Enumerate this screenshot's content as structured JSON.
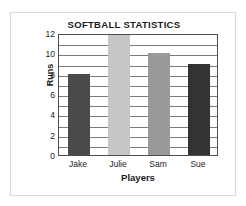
{
  "chart_data": {
    "type": "bar",
    "title": "SOFTBALL STATISTICS",
    "xlabel": "Players",
    "ylabel": "Runs",
    "categories": [
      "Jake",
      "Julie",
      "Sam",
      "Sue"
    ],
    "values": [
      8,
      12,
      10,
      9
    ],
    "bar_colors": [
      "#4a4a4a",
      "#c6c6c6",
      "#999999",
      "#333333"
    ],
    "ylim": [
      0,
      12
    ],
    "y_ticks": [
      0,
      2,
      4,
      6,
      8,
      10,
      12
    ],
    "y_tick_labels": [
      "0",
      "2",
      "4",
      "6",
      "8",
      "10",
      "12"
    ],
    "gridlines": [
      1,
      2,
      3,
      4,
      5,
      6,
      7,
      8,
      9,
      10,
      11
    ],
    "grid": true,
    "grid_color": "#7a7a7a",
    "legend": null,
    "axis_color": "#4d4d4d",
    "background": "#ffffff",
    "frame_color": "#d9d9d9"
  }
}
